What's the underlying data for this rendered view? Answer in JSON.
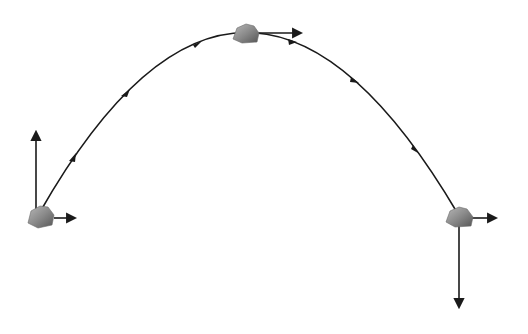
{
  "diagram": {
    "type": "projectile-motion",
    "background": "#ffffff",
    "stroke_color": "#1a1a1a",
    "trajectory": {
      "start": [
        40,
        212
      ],
      "peak": [
        245,
        33
      ],
      "end": [
        458,
        214
      ],
      "direction_arrows": [
        [
          72,
          157
        ],
        [
          125,
          92
        ],
        [
          197,
          43
        ],
        [
          292,
          41
        ],
        [
          355,
          80
        ],
        [
          417,
          148
        ]
      ]
    },
    "positions": [
      {
        "name": "launch",
        "rock_center": [
          41,
          217
        ],
        "vectors": [
          {
            "component": "vertical",
            "from": [
              36,
              210
            ],
            "to": [
              36,
              130
            ]
          },
          {
            "component": "horizontal",
            "from": [
              54,
              218
            ],
            "to": [
              76,
              218
            ]
          }
        ]
      },
      {
        "name": "peak",
        "rock_center": [
          245,
          34
        ],
        "vectors": [
          {
            "component": "horizontal",
            "from": [
              258,
              33
            ],
            "to": [
              302,
              33
            ]
          }
        ]
      },
      {
        "name": "landing",
        "rock_center": [
          459,
          217
        ],
        "vectors": [
          {
            "component": "horizontal",
            "from": [
              472,
              218
            ],
            "to": [
              497,
              218
            ]
          },
          {
            "component": "vertical",
            "from": [
              459,
              226
            ],
            "to": [
              459,
              308
            ]
          }
        ]
      }
    ]
  }
}
